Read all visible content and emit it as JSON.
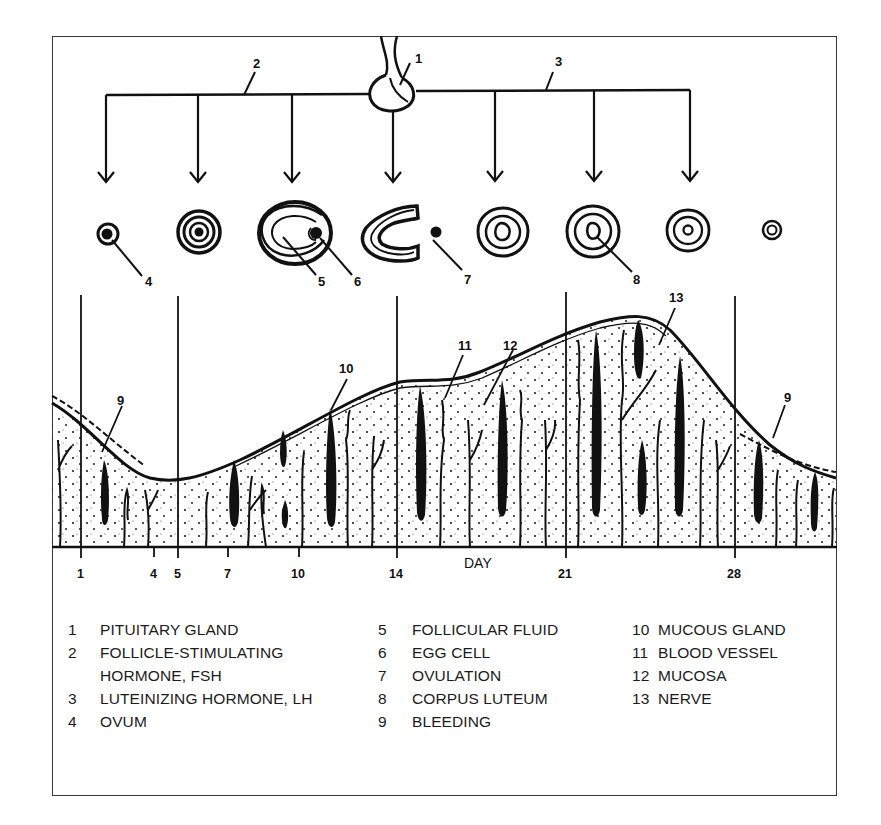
{
  "figure": {
    "title": "",
    "hormone_labels": {
      "pituitary": "1",
      "fsh": "2",
      "lh": "3"
    },
    "follicle_labels": {
      "ovum": "4",
      "follicular_fluid": "5",
      "egg_cell": "6",
      "ovulation": "7",
      "corpus_luteum": "8"
    },
    "mucosa_labels": {
      "bleeding_left": "9",
      "mucous_gland": "10",
      "blood_vessel": "11",
      "mucosa": "12",
      "nerve": "13",
      "bleeding_right": "9"
    },
    "axis": {
      "word": "DAY",
      "ticks": [
        "1",
        "4",
        "5",
        "7",
        "10",
        "14",
        "21",
        "28"
      ]
    }
  },
  "legend": {
    "column1": [
      {
        "num": "1",
        "text": "PITUITARY GLAND"
      },
      {
        "num": "2",
        "text": "FOLLICLE-STIMULATING"
      },
      {
        "num": "",
        "text": "HORMONE, FSH"
      },
      {
        "num": "3",
        "text": "LUTEINIZING HORMONE, LH"
      },
      {
        "num": "4",
        "text": "OVUM"
      }
    ],
    "column2": [
      {
        "num": "5",
        "text": "FOLLICULAR FLUID"
      },
      {
        "num": "6",
        "text": "EGG CELL"
      },
      {
        "num": "7",
        "text": "OVULATION"
      },
      {
        "num": "8",
        "text": "CORPUS LUTEUM"
      },
      {
        "num": "9",
        "text": "BLEEDING"
      }
    ],
    "column3": [
      {
        "num": "10",
        "text": "MUCOUS GLAND"
      },
      {
        "num": "11",
        "text": "BLOOD VESSEL"
      },
      {
        "num": "12",
        "text": "MUCOSA"
      },
      {
        "num": "13",
        "text": "NERVE"
      }
    ]
  },
  "colors": {
    "ink": "#111111",
    "frame": "#3a3a3a",
    "background": "#ffffff"
  }
}
